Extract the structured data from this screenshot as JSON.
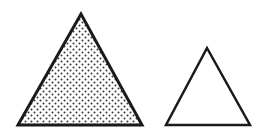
{
  "figure": {
    "shapes": [
      {
        "name": "large-triangle",
        "fill": "dotted",
        "points": "81,14 18,125 142,125"
      },
      {
        "name": "small-triangle",
        "fill": "none",
        "points": "207,48 166,125 250,125"
      }
    ],
    "stroke_color": "#1a1a1a",
    "dot_color": "#333333",
    "background": "#ffffff"
  }
}
